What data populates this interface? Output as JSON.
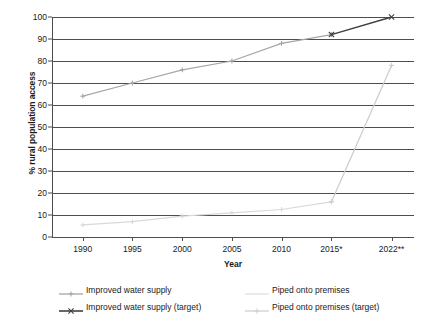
{
  "chart_data": {
    "type": "line",
    "title": "",
    "xlabel": "Year",
    "ylabel": "% rural population access",
    "x": [
      "1990",
      "1995",
      "2000",
      "2005",
      "2010",
      "2015*",
      "2022**"
    ],
    "xlim": [
      1988,
      2024
    ],
    "ylim": [
      0,
      100
    ],
    "ytick_labels": [
      "0",
      "10",
      "20",
      "30",
      "40",
      "50",
      "60",
      "70",
      "80",
      "90",
      "100"
    ],
    "ytick_values": [
      0,
      10,
      20,
      30,
      40,
      50,
      60,
      70,
      80,
      90,
      100
    ],
    "grid": true,
    "legend_position": "bottom",
    "series": [
      {
        "name": "Improved water supply",
        "color": "#a6a6a6",
        "marker": "plus",
        "x": [
          "1990",
          "1995",
          "2000",
          "2005",
          "2010",
          "2015*"
        ],
        "values": [
          64,
          70,
          76,
          80,
          88,
          92
        ]
      },
      {
        "name": "Piped onto premises",
        "color": "#d9d9d9",
        "marker": "plus",
        "x": [
          "1990",
          "1995",
          "2000",
          "2005",
          "2010",
          "2015*"
        ],
        "values": [
          5.5,
          7,
          9.5,
          11,
          12.5,
          16
        ]
      },
      {
        "name": "Improved water supply (target)",
        "color": "#404040",
        "marker": "cross",
        "x": [
          "2015*",
          "2022**"
        ],
        "values": [
          92,
          100
        ]
      },
      {
        "name": "Piped onto premises (target)",
        "color": "#cccccc",
        "marker": "plus",
        "x": [
          "2015*",
          "2022**"
        ],
        "values": [
          16,
          78
        ]
      }
    ]
  },
  "axes": {
    "y_title": "% rural population access",
    "x_title": "Year",
    "y_ticks": [
      "100",
      "90",
      "80",
      "70",
      "60",
      "50",
      "40",
      "30",
      "20",
      "10",
      "0"
    ],
    "x_ticks": [
      "1990",
      "1995",
      "2000",
      "2005",
      "2010",
      "2015*",
      "2022**"
    ]
  },
  "legend": {
    "rows": [
      {
        "left": {
          "label": "Improved water supply",
          "color": "#a6a6a6",
          "marker": "plus"
        },
        "right": {
          "label": "Piped onto premises",
          "color": "#e0e0e0",
          "marker": "plain"
        }
      },
      {
        "left": {
          "label": "Improved water supply (target)",
          "color": "#404040",
          "marker": "cross"
        },
        "right": {
          "label": "Piped onto premises (target)",
          "color": "#cfcfcf",
          "marker": "plus"
        }
      }
    ]
  },
  "colors": {
    "axis": "#4d4d4d",
    "text": "#1a1a1a",
    "background": "#ffffff"
  }
}
